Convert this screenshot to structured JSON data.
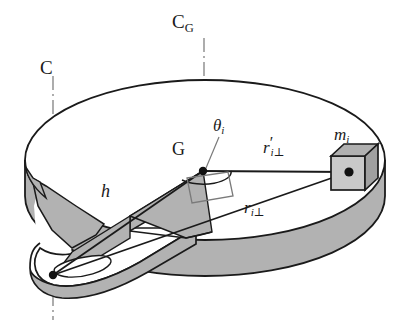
{
  "figure": {
    "name": "rigid-body-rotating-disk-diagram",
    "background_color": "#ffffff",
    "line_color": "#1a1a1a",
    "shade_color": "#b2b2b2",
    "shade_color_dark": "#9a9a9a",
    "cube_face_color": "#c9c9c9",
    "cube_top_color": "#b0b0b0",
    "cube_side_color": "#a0a0a0"
  },
  "labels": {
    "axis_cg": {
      "base": "C",
      "subscript": "G"
    },
    "axis_c": {
      "base": "C"
    },
    "center_of_mass": {
      "text": "G"
    },
    "angle_theta": {
      "base": "θ",
      "subscript": "i"
    },
    "radius_prime": {
      "base": "r",
      "prime": "′",
      "subscript": "i",
      "perp": "⊥"
    },
    "radius": {
      "base": "r",
      "subscript": "i",
      "perp": "⊥"
    },
    "height": {
      "text": "h"
    },
    "mass_element": {
      "base": "m",
      "subscript": "i"
    }
  },
  "geometry": {
    "disk_top_ellipse": {
      "cx": 205,
      "cy": 160,
      "rx": 180,
      "ry": 80
    },
    "disk_thickness": 36,
    "axis_c_x": 53,
    "axis_cg_x": 204,
    "center_of_mass_point": {
      "x": 203,
      "y": 171
    },
    "pivot_point": {
      "x": 53,
      "y": 275
    },
    "mass_point": {
      "x": 349,
      "y": 172
    }
  }
}
